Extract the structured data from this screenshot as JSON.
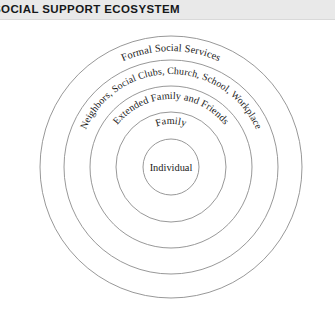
{
  "header": {
    "title": "SOCIAL SUPPORT ECOSYSTEM",
    "band_color": "#e9e9e9",
    "text_color": "#16181a"
  },
  "diagram": {
    "type": "concentric-circles",
    "name": "social-support-ecosystem-diagram",
    "center": {
      "x": 171,
      "y": 147
    },
    "background_color": "#ffffff",
    "outline_color": "#8c8c8c",
    "label_color": "#1a1a1a",
    "rings": [
      {
        "id": "ring-formal-social-services",
        "label": "Formal Social Services",
        "level": 5,
        "radius": 131,
        "fill": "#e3e3e3",
        "label_style": "arc",
        "label_radius": 116
      },
      {
        "id": "ring-neighbors-social-clubs",
        "label": "Neighbors, Social Clubs, Church, School, Workplace",
        "level": 4,
        "radius": 107,
        "fill": "#d6d6d6",
        "label_style": "arc",
        "label_radius": 93
      },
      {
        "id": "ring-extended-family-and-friends",
        "label": "Extended Family and Friends",
        "level": 3,
        "radius": 81,
        "fill": "#c9c9c9",
        "label_style": "arc",
        "label_radius": 68
      },
      {
        "id": "ring-family",
        "label": "Family",
        "level": 2,
        "radius": 55,
        "fill": "#bdbdbd",
        "label_style": "arc",
        "label_radius": 43
      },
      {
        "id": "ring-individual",
        "label": "Individual",
        "level": 1,
        "radius": 28,
        "fill": "#b3b3b3",
        "label_style": "horizontal",
        "label_radius": 0
      }
    ]
  }
}
